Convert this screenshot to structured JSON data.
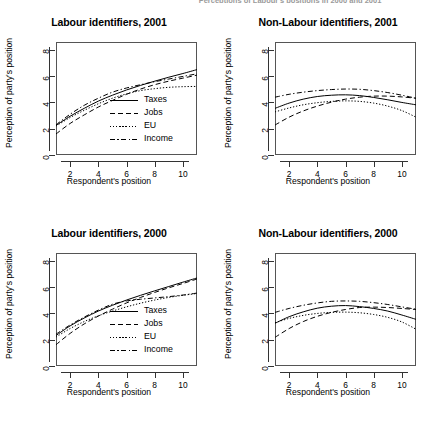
{
  "figure": {
    "cut_off_header": "Perceptions of Labour's positions in 2000 and 2001",
    "width": 437,
    "height": 423
  },
  "axes": {
    "xlabel": "Respondent's position",
    "ylabel": "Perception of party's position",
    "xticks": [
      2,
      4,
      6,
      8,
      10
    ],
    "yticks": [
      0,
      2,
      4,
      6,
      8
    ],
    "xlim": [
      1,
      11
    ],
    "ylim": [
      0,
      8.6
    ]
  },
  "legend": {
    "position": "bottom-right",
    "entries": [
      {
        "label": "Taxes",
        "style": "solid",
        "key": "k-solid"
      },
      {
        "label": "Jobs",
        "style": "dashed",
        "key": "k-dash"
      },
      {
        "label": "EU",
        "style": "dotted",
        "key": "k-dot"
      },
      {
        "label": "Income",
        "style": "dashdot",
        "key": "k-dashdot"
      }
    ]
  },
  "chart_data": [
    {
      "type": "line",
      "panel": "top-left",
      "title": "Labour identifiers, 2001",
      "xlabel": "Respondent's position",
      "ylabel": "Perception of party's position",
      "xlim": [
        1,
        11
      ],
      "ylim": [
        0,
        8.6
      ],
      "xticks": [
        2,
        4,
        6,
        8,
        10
      ],
      "yticks": [
        0,
        2,
        4,
        6,
        8
      ],
      "grid": false,
      "legend": true,
      "x": [
        1,
        2,
        3,
        4,
        5,
        6,
        7,
        8,
        9,
        10,
        11
      ],
      "series": [
        {
          "name": "Taxes",
          "style": "solid",
          "values": [
            2.25,
            2.95,
            3.55,
            4.1,
            4.55,
            4.95,
            5.3,
            5.62,
            5.92,
            6.2,
            6.5
          ]
        },
        {
          "name": "Jobs",
          "style": "dashed",
          "values": [
            1.6,
            2.4,
            3.05,
            3.65,
            4.15,
            4.62,
            5.02,
            5.35,
            5.62,
            5.85,
            6.08
          ]
        },
        {
          "name": "EU",
          "style": "dotted",
          "values": [
            2.2,
            2.85,
            3.4,
            3.9,
            4.32,
            4.65,
            4.9,
            5.05,
            5.15,
            5.2,
            5.22
          ]
        },
        {
          "name": "Income",
          "style": "dashdot",
          "values": [
            2.3,
            3.1,
            3.78,
            4.32,
            4.78,
            5.1,
            5.35,
            5.58,
            5.78,
            5.98,
            6.18
          ]
        }
      ]
    },
    {
      "type": "line",
      "panel": "top-right",
      "title": "Non-Labour identifiers, 2001",
      "xlabel": "Respondent's position",
      "ylabel": "Perception of party's position",
      "xlim": [
        1,
        11
      ],
      "ylim": [
        0,
        8.6
      ],
      "xticks": [
        2,
        4,
        6,
        8,
        10
      ],
      "yticks": [
        0,
        2,
        4,
        6,
        8
      ],
      "grid": false,
      "legend": false,
      "x": [
        1,
        2,
        3,
        4,
        5,
        6,
        7,
        8,
        9,
        10,
        11
      ],
      "series": [
        {
          "name": "Taxes",
          "style": "solid",
          "values": [
            3.55,
            3.95,
            4.25,
            4.45,
            4.55,
            4.58,
            4.52,
            4.38,
            4.2,
            4.0,
            3.82
          ]
        },
        {
          "name": "Jobs",
          "style": "dashed",
          "values": [
            2.28,
            2.88,
            3.35,
            3.72,
            4.02,
            4.25,
            4.4,
            4.48,
            4.48,
            4.42,
            4.32
          ]
        },
        {
          "name": "EU",
          "style": "dotted",
          "values": [
            3.28,
            3.58,
            3.82,
            3.98,
            4.08,
            4.12,
            4.08,
            3.95,
            3.72,
            3.38,
            2.88
          ]
        },
        {
          "name": "Income",
          "style": "dashdot",
          "values": [
            4.4,
            4.62,
            4.78,
            4.9,
            4.98,
            5.02,
            5.0,
            4.9,
            4.75,
            4.55,
            4.32
          ]
        }
      ]
    },
    {
      "type": "line",
      "panel": "bottom-left",
      "title": "Labour identifiers, 2000",
      "xlabel": "Respondent's position",
      "ylabel": "Perception of party's position",
      "xlim": [
        1,
        11
      ],
      "ylim": [
        0,
        8.6
      ],
      "xticks": [
        2,
        4,
        6,
        8,
        10
      ],
      "yticks": [
        0,
        2,
        4,
        6,
        8
      ],
      "grid": false,
      "legend": true,
      "x": [
        1,
        2,
        3,
        4,
        5,
        6,
        7,
        8,
        9,
        10,
        11
      ],
      "series": [
        {
          "name": "Taxes",
          "style": "solid",
          "values": [
            2.32,
            3.05,
            3.65,
            4.18,
            4.62,
            5.02,
            5.38,
            5.72,
            6.05,
            6.38,
            6.7
          ]
        },
        {
          "name": "Jobs",
          "style": "dashed",
          "values": [
            1.62,
            2.48,
            3.2,
            3.8,
            4.32,
            4.8,
            5.22,
            5.6,
            5.95,
            6.28,
            6.62
          ]
        },
        {
          "name": "EU",
          "style": "dotted",
          "values": [
            2.2,
            2.85,
            3.38,
            3.82,
            4.18,
            4.5,
            4.78,
            5.02,
            5.22,
            5.38,
            5.52
          ]
        },
        {
          "name": "Income",
          "style": "dashdot",
          "values": [
            2.42,
            3.12,
            3.72,
            4.25,
            4.7,
            4.95,
            5.08,
            5.18,
            5.28,
            5.4,
            5.55
          ]
        }
      ]
    },
    {
      "type": "line",
      "panel": "bottom-right",
      "title": "Non-Labour identifiers, 2000",
      "xlabel": "Respondent's position",
      "ylabel": "Perception of party's position",
      "xlim": [
        1,
        11
      ],
      "ylim": [
        0,
        8.6
      ],
      "xticks": [
        2,
        4,
        6,
        8,
        10
      ],
      "yticks": [
        0,
        2,
        4,
        6,
        8
      ],
      "grid": false,
      "legend": false,
      "x": [
        1,
        2,
        3,
        4,
        5,
        6,
        7,
        8,
        9,
        10,
        11
      ],
      "series": [
        {
          "name": "Taxes",
          "style": "solid",
          "values": [
            3.25,
            3.75,
            4.12,
            4.4,
            4.55,
            4.6,
            4.52,
            4.38,
            4.18,
            3.88,
            3.55
          ]
        },
        {
          "name": "Jobs",
          "style": "dashed",
          "values": [
            2.18,
            2.85,
            3.38,
            3.78,
            4.08,
            4.3,
            4.45,
            4.48,
            4.45,
            4.38,
            4.3
          ]
        },
        {
          "name": "EU",
          "style": "dotted",
          "values": [
            3.3,
            3.62,
            3.85,
            4.0,
            4.08,
            4.1,
            4.05,
            3.92,
            3.7,
            3.35,
            2.8
          ]
        },
        {
          "name": "Income",
          "style": "dashdot",
          "values": [
            4.08,
            4.38,
            4.62,
            4.8,
            4.92,
            4.95,
            4.92,
            4.82,
            4.68,
            4.5,
            4.32
          ]
        }
      ]
    }
  ]
}
